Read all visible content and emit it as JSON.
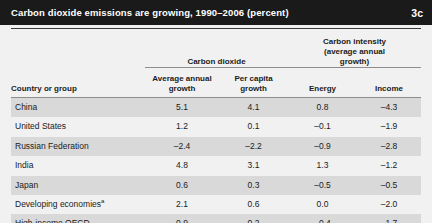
{
  "figure": {
    "title": "Carbon dioxide emissions are growing, 1990–2006 (percent)",
    "badge": "3c",
    "title_bar_color": "#1a1a1a",
    "background_color": "#f1f1f1",
    "row_shade_color": "#d9d9d9",
    "rule_color": "#8e8e8e"
  },
  "table": {
    "group_headers": {
      "carbon_dioxide": "Carbon dioxide",
      "carbon_intensity": "Carbon intensity\n(average annual\ngrowth)",
      "carbon_intensity_line1": "Carbon intensity",
      "carbon_intensity_line2": "(average annual",
      "carbon_intensity_line3": "growth)"
    },
    "columns": [
      {
        "key": "country",
        "label": "Country or group",
        "align": "left"
      },
      {
        "key": "avg_annual_growth",
        "label": "Average annual\ngrowth",
        "line1": "Average annual",
        "line2": "growth",
        "align": "center"
      },
      {
        "key": "per_capita_growth",
        "label": "Per capita\ngrowth",
        "line1": "Per capita",
        "line2": "growth",
        "align": "center"
      },
      {
        "key": "energy",
        "label": "Energy",
        "align": "center"
      },
      {
        "key": "income",
        "label": "Income",
        "align": "center"
      }
    ],
    "rows": [
      {
        "country": "China",
        "footnote": "",
        "avg_annual_growth": "5.1",
        "per_capita_growth": "4.1",
        "energy": "0.8",
        "income": "–4.3",
        "shaded": true
      },
      {
        "country": "United States",
        "footnote": "",
        "avg_annual_growth": "1.2",
        "per_capita_growth": "0.1",
        "energy": "–0.1",
        "income": "–1.9",
        "shaded": false
      },
      {
        "country": "Russian Federation",
        "footnote": "",
        "avg_annual_growth": "–2.4",
        "per_capita_growth": "–2.2",
        "energy": "–0.9",
        "income": "–2.8",
        "shaded": true
      },
      {
        "country": "India",
        "footnote": "",
        "avg_annual_growth": "4.8",
        "per_capita_growth": "3.1",
        "energy": "1.3",
        "income": "–1.2",
        "shaded": false
      },
      {
        "country": "Japan",
        "footnote": "",
        "avg_annual_growth": "0.6",
        "per_capita_growth": "0.3",
        "energy": "–0.5",
        "income": "–0.5",
        "shaded": true
      },
      {
        "country": "Developing economies",
        "footnote": "a",
        "avg_annual_growth": "2.1",
        "per_capita_growth": "0.6",
        "energy": "0.0",
        "income": "–2.0",
        "shaded": false
      },
      {
        "country": "High-income OECD",
        "footnote": "",
        "avg_annual_growth": "0.9",
        "per_capita_growth": "0.2",
        "energy": "–0.4",
        "income": "–1.7",
        "shaded": true
      }
    ]
  },
  "chart_data": {
    "type": "table",
    "title": "Carbon dioxide emissions are growing, 1990–2006 (percent)",
    "units": "percent",
    "period": "1990–2006",
    "categories": [
      "China",
      "United States",
      "Russian Federation",
      "India",
      "Japan",
      "Developing economies",
      "High-income OECD"
    ],
    "series": [
      {
        "name": "Carbon dioxide – Average annual growth",
        "group": "Carbon dioxide",
        "values": [
          5.1,
          1.2,
          -2.4,
          4.8,
          0.6,
          2.1,
          0.9
        ]
      },
      {
        "name": "Carbon dioxide – Per capita growth",
        "group": "Carbon dioxide",
        "values": [
          4.1,
          0.1,
          -2.2,
          3.1,
          0.3,
          0.6,
          0.2
        ]
      },
      {
        "name": "Carbon intensity – Energy",
        "group": "Carbon intensity (average annual growth)",
        "values": [
          0.8,
          -0.1,
          -0.9,
          1.3,
          -0.5,
          0.0,
          -0.4
        ]
      },
      {
        "name": "Carbon intensity – Income",
        "group": "Carbon intensity (average annual growth)",
        "values": [
          -4.3,
          -1.9,
          -2.8,
          -1.2,
          -0.5,
          -2.0,
          -1.7
        ]
      }
    ],
    "xlabel": "Country or group",
    "ylabel": "percent",
    "grid": false,
    "legend": "none"
  }
}
